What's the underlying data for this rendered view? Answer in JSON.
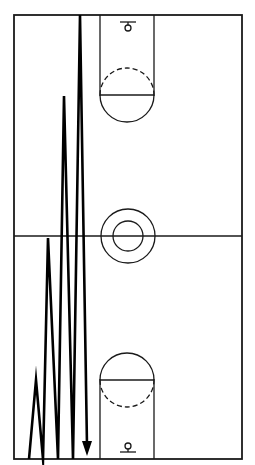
{
  "diagram": {
    "title": "Basketball full-court zigzag sprint drill",
    "court": {
      "type": "full-court",
      "features": [
        "sideline",
        "baseline",
        "half-court-line",
        "center-circle",
        "inner-center-circle",
        "free-throw-lane",
        "free-throw-circle",
        "basket"
      ]
    },
    "drill": {
      "description": "Zigzag run from baseline, touching baseline and sprinting progressively farther up the court each time",
      "segments": [
        {
          "from": "baseline",
          "to": "near baseline area"
        },
        {
          "from": "near baseline area",
          "to": "baseline"
        },
        {
          "from": "baseline",
          "to": "just past half-court"
        },
        {
          "from": "just past half-court",
          "to": "baseline"
        },
        {
          "from": "baseline",
          "to": "far free-throw line"
        },
        {
          "from": "far free-throw line",
          "to": "baseline"
        },
        {
          "from": "baseline",
          "to": "far baseline"
        },
        {
          "from": "far baseline",
          "to": "baseline"
        }
      ],
      "direction": "ends with arrow pointing down at near baseline",
      "color": "#000000"
    },
    "colors": {
      "lines": "#1a1a1a",
      "background": "#ffffff"
    }
  }
}
